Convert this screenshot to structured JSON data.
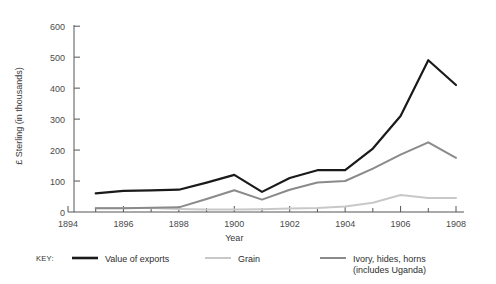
{
  "chart_data": {
    "type": "line",
    "title": "",
    "xlabel": "Year",
    "ylabel": "£ Sterling (in thousands)",
    "x": [
      1895,
      1896,
      1897,
      1898,
      1899,
      1900,
      1901,
      1902,
      1903,
      1904,
      1905,
      1906,
      1907,
      1908
    ],
    "xlim": [
      1894,
      1908
    ],
    "ylim": [
      0,
      620
    ],
    "xticks": [
      1894,
      1896,
      1898,
      1900,
      1902,
      1904,
      1906,
      1908
    ],
    "xticklabels": [
      "1894",
      "1896",
      "1898",
      "1900",
      "1902",
      "1904",
      "1906",
      "1908"
    ],
    "xminorticks": [
      1895,
      1897,
      1899,
      1901,
      1903,
      1905,
      1907
    ],
    "yticks": [
      0,
      100,
      200,
      300,
      400,
      500,
      600
    ],
    "yticklabels": [
      "0",
      "100",
      "200",
      "300",
      "400",
      "500",
      "600"
    ],
    "grid": false,
    "legend_position": "below",
    "series": [
      {
        "name": "Value of exports",
        "color": "#1a1a1a",
        "width": 2.2,
        "values": [
          60,
          68,
          70,
          72,
          95,
          120,
          65,
          110,
          135,
          135,
          205,
          310,
          490,
          410
        ]
      },
      {
        "name": "Grain",
        "color": "#c8c8c8",
        "width": 2.0,
        "values": [
          13,
          13,
          13,
          10,
          8,
          8,
          9,
          11,
          13,
          18,
          30,
          55,
          45,
          45
        ]
      },
      {
        "name": "Ivory, hides, horns (includes Uganda)",
        "color": "#8a8a8a",
        "width": 2.0,
        "values": [
          12,
          12,
          14,
          15,
          42,
          70,
          40,
          72,
          95,
          100,
          140,
          185,
          225,
          175
        ]
      }
    ]
  },
  "legend": {
    "key_label": "KEY:",
    "entries": [
      {
        "label": "Value of exports",
        "label2": "",
        "color": "#1a1a1a"
      },
      {
        "label": "Grain",
        "label2": "",
        "color": "#c8c8c8"
      },
      {
        "label": "Ivory, hides, horns",
        "label2": "(includes Uganda)",
        "color": "#8a8a8a"
      }
    ]
  }
}
